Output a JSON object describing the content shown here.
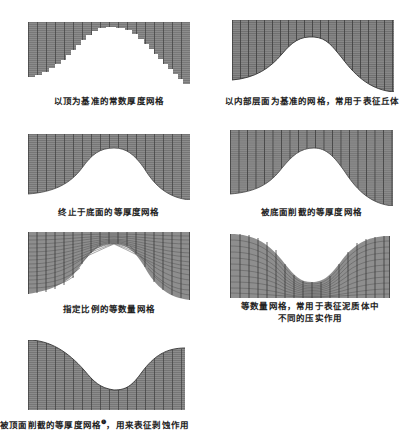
{
  "figure": {
    "panels": [
      {
        "id": "p1",
        "caption": "以顶为基准的常数厚度网格",
        "grid_type": "stepped-top-referenced-constant-thickness",
        "box": {
          "x": 28,
          "y": 22,
          "w": 162,
          "h": 60
        }
      },
      {
        "id": "p2",
        "caption": "以内部层面为基准的网格，常用于表征丘体",
        "grid_type": "internal-surface-referenced",
        "box": {
          "x": 232,
          "y": 20,
          "w": 162,
          "h": 70
        }
      },
      {
        "id": "p3",
        "caption": "终止于底面的等厚度网格",
        "grid_type": "constant-thickness-terminated-at-base",
        "box": {
          "x": 28,
          "y": 134,
          "w": 162,
          "h": 64
        }
      },
      {
        "id": "p4",
        "caption": "被底面削截的等厚度网格",
        "grid_type": "constant-thickness-truncated-by-base",
        "box": {
          "x": 230,
          "y": 130,
          "w": 163,
          "h": 75
        }
      },
      {
        "id": "p5",
        "caption": "指定比例的等数量网格",
        "grid_type": "proportional-equal-count",
        "box": {
          "x": 28,
          "y": 232,
          "w": 162,
          "h": 65
        }
      },
      {
        "id": "p6",
        "caption_lines": [
          "等数量网格，常用于表征泥质体中",
          "不同的压实作用"
        ],
        "grid_type": "equal-count-compaction",
        "box": {
          "x": 230,
          "y": 232,
          "w": 160,
          "h": 65
        }
      },
      {
        "id": "p7",
        "caption": "被顶面削截的等厚度网格",
        "caption_footnote": "❶",
        "caption_suffix": "，用来表征剥蚀作用",
        "grid_type": "constant-thickness-truncated-by-top",
        "box": {
          "x": 28,
          "y": 340,
          "w": 157,
          "h": 68
        }
      }
    ],
    "colors": {
      "grid_fill": "#8a8a8a",
      "grid_line_dark": "#4a4a4a",
      "grid_line_light": "#b0b0b0",
      "background": "#ffffff",
      "text": "#222222"
    }
  }
}
